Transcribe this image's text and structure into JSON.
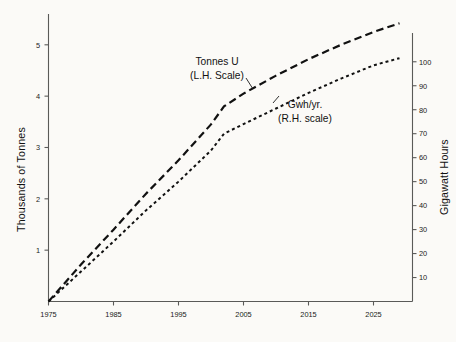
{
  "chart_data": {
    "type": "line",
    "title": "",
    "xlabel": "",
    "ylabel": "Thousands of Tonnes",
    "y2label": "Gigawatt Hours",
    "grid": false,
    "legend_position": "inline-annotation",
    "xlim": [
      1975,
      2031
    ],
    "ylim": [
      0,
      5.6
    ],
    "y2lim": [
      0,
      112
    ],
    "xticks": [
      "1975",
      "1985",
      "1995",
      "2005",
      "2015",
      "2025"
    ],
    "xtick_values": [
      1975,
      1985,
      1995,
      2005,
      2015,
      2025
    ],
    "yticks": [
      "1",
      "2",
      "3",
      "4",
      "5"
    ],
    "ytick_values": [
      1,
      2,
      3,
      4,
      5
    ],
    "y2ticks": [
      "10",
      "20",
      "30",
      "40",
      "50",
      "60",
      "70",
      "80",
      "90",
      "100"
    ],
    "y2tick_values": [
      10,
      20,
      30,
      40,
      50,
      60,
      70,
      80,
      90,
      100
    ],
    "series": [
      {
        "name": "Tonnes U",
        "axis": "left",
        "style": "long-dash",
        "label_line1": "Tonnes U",
        "label_line2": "(L.H. Scale)",
        "x": [
          1975,
          1980,
          1985,
          1990,
          1995,
          2000,
          2002,
          2005,
          2010,
          2015,
          2020,
          2025,
          2029
        ],
        "values": [
          0.0,
          0.72,
          1.4,
          2.1,
          2.75,
          3.45,
          3.8,
          4.05,
          4.4,
          4.72,
          5.0,
          5.25,
          5.42
        ]
      },
      {
        "name": "Gwh/yr.",
        "axis": "right",
        "style": "short-dot",
        "label_line1": "Gwh/yr.",
        "label_line2": "(R.H. scale)",
        "x": [
          1975,
          1980,
          1985,
          1990,
          1995,
          2000,
          2002,
          2005,
          2010,
          2015,
          2020,
          2025,
          2029
        ],
        "values": [
          0.0,
          12.5,
          25.0,
          38.0,
          50.0,
          63.0,
          70.0,
          74.0,
          80.5,
          87.0,
          93.0,
          98.5,
          101.5
        ]
      }
    ],
    "annotations": [
      {
        "text": "Tonnes U (L.H. Scale)",
        "points_to_series": "Tonnes U"
      },
      {
        "text": "Gwh/yr. (R.H. scale)",
        "points_to_series": "Gwh/yr."
      }
    ],
    "colors": {
      "line": "#111111",
      "axis": "#5a5a58",
      "background": "#fbfaf7"
    }
  }
}
